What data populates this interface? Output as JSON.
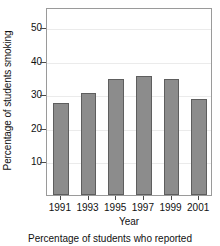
{
  "chart_data": {
    "type": "bar",
    "title": "",
    "xlabel": "Year",
    "ylabel": "Percentage of students smoking",
    "categories": [
      "1991",
      "1993",
      "1995",
      "1997",
      "1999",
      "2001"
    ],
    "values": [
      27.5,
      30.5,
      34.7,
      35.6,
      34.7,
      28.6
    ],
    "ylim": [
      0,
      56
    ],
    "yticks": [
      10,
      20,
      30,
      40,
      50
    ],
    "ytick_labels": [
      "10",
      "20",
      "30",
      "40",
      "50"
    ],
    "grid": true,
    "legend": null,
    "bar_color": "#8c8c8c",
    "bar_edge_color": "#5e5e5e",
    "grid_color": "#ebebeb",
    "axis_color": "#9a9a9a"
  },
  "caption": {
    "text": "Percentage of students who reported"
  }
}
